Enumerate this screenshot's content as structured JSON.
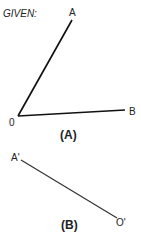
{
  "given_label": "GIVEN:",
  "figure_a": {
    "caption": "(A)",
    "vertex_label": "0",
    "ray1_end_label": "A",
    "ray2_end_label": "B"
  },
  "figure_b": {
    "caption": "(B)",
    "start_label": "A'",
    "end_label": "O'"
  },
  "colors": {
    "line": "#111111",
    "text": "#222222"
  }
}
